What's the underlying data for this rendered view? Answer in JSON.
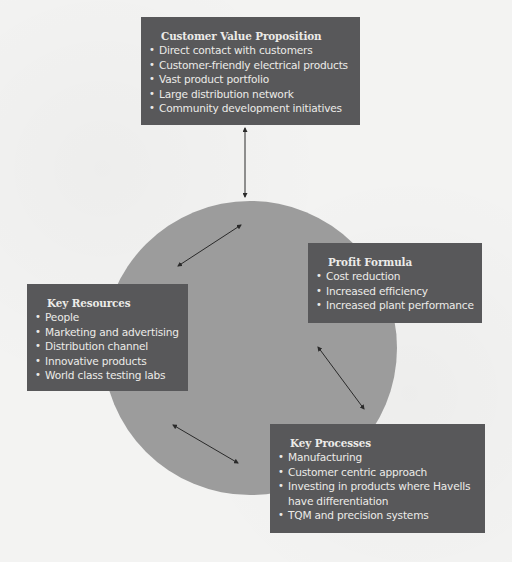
{
  "diagram": {
    "colors": {
      "background": "#f3f3f2",
      "circle": "#9c9c9c",
      "box": "#58585a",
      "box_text": "#ecebe8",
      "arrow": "#2a2a2a"
    },
    "customer_value_proposition": {
      "title": "Customer Value Proposition",
      "items": [
        "Direct contact with customers",
        "Customer-friendly electrical products",
        "Vast product portfolio",
        "Large distribution network",
        "Community development initiatives"
      ]
    },
    "key_resources": {
      "title": "Key Resources",
      "items": [
        "People",
        "Marketing and advertising",
        "Distribution channel",
        "Innovative products",
        "World class testing labs"
      ]
    },
    "profit_formula": {
      "title": "Profit Formula",
      "items": [
        "Cost reduction",
        "Increased efficiency",
        "Increased plant performance"
      ]
    },
    "key_processes": {
      "title": "Key Processes",
      "items": [
        "Manufacturing",
        "Customer centric approach",
        "Investing in products where Havells have differentiation",
        "TQM and precision systems"
      ]
    },
    "connectors": [
      {
        "from": "customer_value_proposition",
        "to": "circle",
        "type": "double-arrow"
      },
      {
        "from": "key_resources",
        "to": "circle",
        "type": "double-arrow"
      },
      {
        "from": "profit_formula",
        "to": "circle",
        "type": "double-arrow"
      },
      {
        "from": "key_processes",
        "to": "circle",
        "type": "double-arrow"
      }
    ]
  }
}
